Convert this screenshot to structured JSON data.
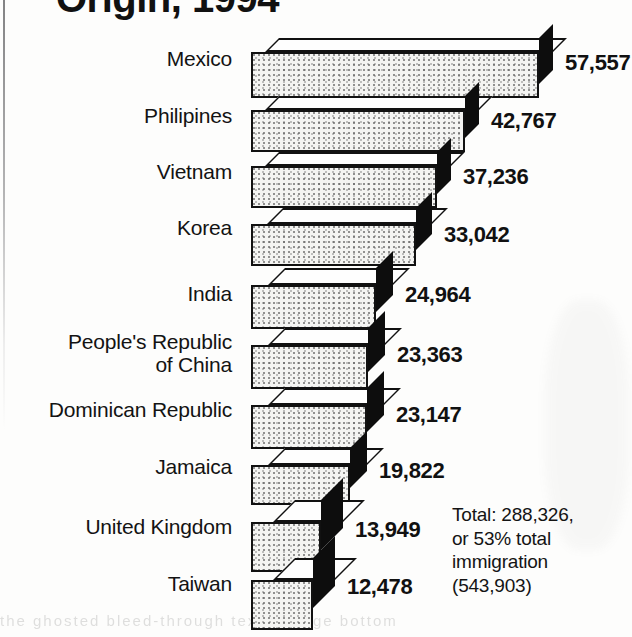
{
  "title": {
    "text": "Origin, 1994",
    "note": "clipped at top edge of scan"
  },
  "total_note": {
    "line1": "Total: 288,326,",
    "line2": "or 53% total",
    "line3": "immigration",
    "line4": "(543,903)"
  },
  "ghost_text": "the ghosted bleed-through text at page bottom",
  "chart_data": {
    "type": "bar",
    "orientation": "horizontal",
    "style": "3d-isometric",
    "title": "Origin, 1994",
    "xlabel": "",
    "ylabel": "",
    "grid": false,
    "legend": "none",
    "xlim": [
      0,
      57557
    ],
    "categories": [
      "Mexico",
      "Philipines",
      "Vietnam",
      "Korea",
      "India",
      "People's Republic\nof China",
      "Dominican Republic",
      "Jamaica",
      "United Kingdom",
      "Taiwan"
    ],
    "values": [
      57557,
      42767,
      37236,
      33042,
      24964,
      23363,
      23147,
      19822,
      13949,
      12478
    ],
    "value_labels": [
      "57,557",
      "42,767",
      "37,236",
      "33,042",
      "24,964",
      "23,363",
      "23,147",
      "19,822",
      "13,949",
      "12,478"
    ],
    "annotation": "Total: 288,326, or 53% total immigration (543,903)",
    "total": 288326,
    "total_share_pct": 53,
    "total_immigration": 543903
  },
  "colors": {
    "ink": "#111111",
    "bar_face": "#f4f4f2",
    "bar_top": "#fefefe",
    "bar_cap": "#0d0d0d",
    "page": "#fdfdfc"
  }
}
